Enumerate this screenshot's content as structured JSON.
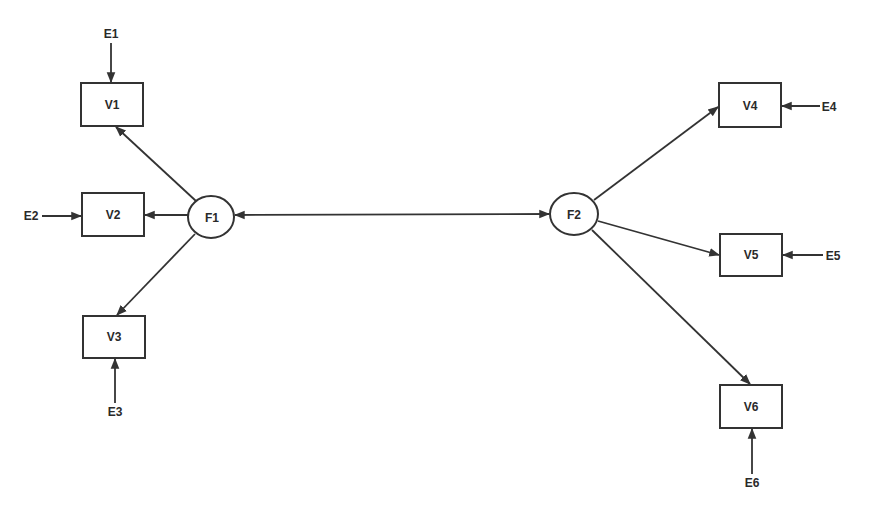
{
  "diagram": {
    "type": "structural-equation-model",
    "factors": [
      {
        "id": "F1",
        "label": "F1",
        "cx": 211,
        "cy": 217,
        "rx": 23,
        "ry": 21
      },
      {
        "id": "F2",
        "label": "F2",
        "cx": 574,
        "cy": 214,
        "rx": 24,
        "ry": 21
      }
    ],
    "observed": [
      {
        "id": "V1",
        "label": "V1",
        "x": 81,
        "y": 83,
        "w": 62,
        "h": 43
      },
      {
        "id": "V2",
        "label": "V2",
        "x": 82,
        "y": 193,
        "w": 62,
        "h": 43
      },
      {
        "id": "V3",
        "label": "V3",
        "x": 83,
        "y": 316,
        "w": 62,
        "h": 42
      },
      {
        "id": "V4",
        "label": "V4",
        "x": 719,
        "y": 83,
        "w": 62,
        "h": 44
      },
      {
        "id": "V5",
        "label": "V5",
        "x": 720,
        "y": 234,
        "w": 62,
        "h": 42
      },
      {
        "id": "V6",
        "label": "V6",
        "x": 720,
        "y": 385,
        "w": 62,
        "h": 43
      }
    ],
    "errors": [
      {
        "id": "E1",
        "label": "E1",
        "x": 111,
        "y": 37
      },
      {
        "id": "E2",
        "label": "E2",
        "x": 32,
        "y": 220
      },
      {
        "id": "E3",
        "label": "E3",
        "x": 115,
        "y": 416
      },
      {
        "id": "E4",
        "label": "E4",
        "x": 827,
        "y": 111
      },
      {
        "id": "E5",
        "label": "E5",
        "x": 834,
        "y": 260
      },
      {
        "id": "E6",
        "label": "E6",
        "x": 752,
        "y": 486
      }
    ],
    "paths": [
      {
        "from": "F1",
        "to": "V1",
        "type": "directed"
      },
      {
        "from": "F1",
        "to": "V2",
        "type": "directed"
      },
      {
        "from": "F1",
        "to": "V3",
        "type": "directed"
      },
      {
        "from": "F2",
        "to": "V4",
        "type": "directed"
      },
      {
        "from": "F2",
        "to": "V5",
        "type": "directed"
      },
      {
        "from": "F2",
        "to": "V6",
        "type": "directed"
      },
      {
        "from": "E1",
        "to": "V1",
        "type": "directed"
      },
      {
        "from": "E2",
        "to": "V2",
        "type": "directed"
      },
      {
        "from": "E3",
        "to": "V3",
        "type": "directed"
      },
      {
        "from": "E4",
        "to": "V4",
        "type": "directed"
      },
      {
        "from": "E5",
        "to": "V5",
        "type": "directed"
      },
      {
        "from": "E6",
        "to": "V6",
        "type": "directed"
      },
      {
        "from": "F1",
        "to": "F2",
        "type": "bidirectional"
      }
    ]
  }
}
